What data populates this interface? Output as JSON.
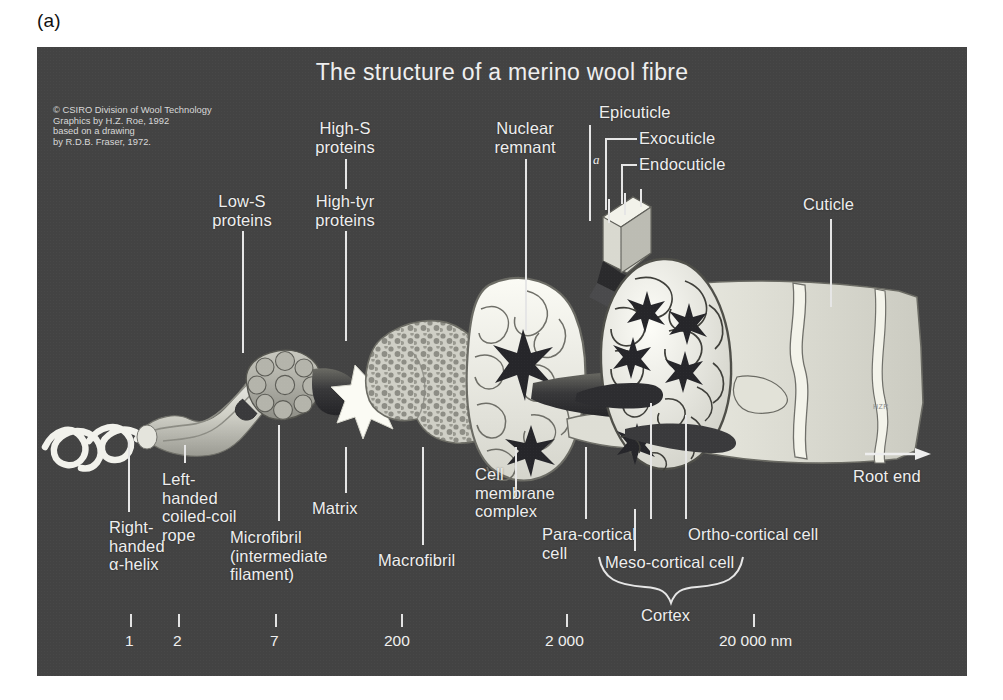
{
  "figure": {
    "panel_tag": "(a)",
    "title": "The structure of a merino wool fibre",
    "background_color": "#434343",
    "label_color": "#eeeeee",
    "credit": "© CSIRO Division of Wool Technology\nGraphics by H.Z. Roe, 1992\nbased on a drawing\nby R.D.B. Fraser, 1972.",
    "signature": "HZR"
  },
  "labels": {
    "low_s": "Low-S\nproteins",
    "high_s": "High-S\nproteins",
    "high_tyr": "High-tyr\nproteins",
    "nuclear_remnant": "Nuclear\nremnant",
    "epicuticle": "Epicuticle",
    "exocuticle": "Exocuticle",
    "endocuticle": "Endocuticle",
    "cuticle": "Cuticle",
    "right_handed_helix": "Right-\nhanded\nα-helix",
    "left_handed_rope": "Left-\nhanded\ncoiled-coil\nrope",
    "matrix": "Matrix",
    "microfibril": "Microfibril\n(intermediate\nfilament)",
    "macrofibril": "Macrofibril",
    "cell_membrane_complex": "Cell\nmembrane\ncomplex",
    "para_cortical_cell": "Para-cortical\ncell",
    "ortho_cortical_cell": "Ortho-cortical cell",
    "meso_cortical_cell": "Meso-cortical cell",
    "cortex": "Cortex",
    "root_end": "Root end",
    "a_marker": "a"
  },
  "scale_bar": {
    "unit": "nm",
    "ticks": [
      {
        "label": "1",
        "value": 1
      },
      {
        "label": "2",
        "value": 2
      },
      {
        "label": "7",
        "value": 7
      },
      {
        "label": "200",
        "value": 200
      },
      {
        "label": "2 000",
        "value": 2000
      },
      {
        "label": "20 000 nm",
        "value": 20000
      }
    ]
  }
}
